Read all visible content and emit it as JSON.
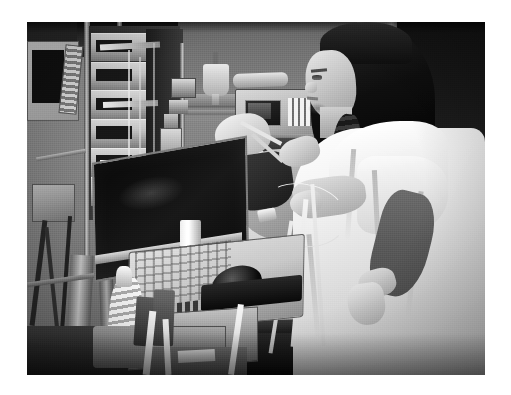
{
  "page": {
    "type": "photograph",
    "width": 511,
    "height": 395,
    "background_color": "#ffffff",
    "color_mode": "grayscale",
    "caption": ""
  },
  "photo": {
    "frame": {
      "left": 27,
      "top": 22,
      "width": 458,
      "height": 353
    },
    "alt_text": "Black and white photograph of a female clinician in a white gown performing a bedside ultrasound examination on a patient in an intensive care unit bed, surrounded by IV infusion pumps, a ventilator and a portable ultrasound cart.",
    "scene": "intensive-care-unit-bedside-ultrasound",
    "palette": {
      "wall_light": "#8d8d8d",
      "wall_mid": "#7d7d7d",
      "wall_dark": "#6d6d6d",
      "doorway_black": "#181818",
      "equipment_light": "#d2d2d2",
      "equipment_mid": "#9a9a9a",
      "equipment_dark": "#4a4a4a",
      "screen_black": "#101010",
      "gown_white": "#fbfbfb",
      "sheet_white": "#efefef",
      "skin_light": "#cfcfcf",
      "skin_shadow": "#5b5b5b",
      "hair_black": "#121212",
      "cable_white": "#f0f0f0",
      "floor_dark": "#2f2f2f"
    },
    "regions": [
      {
        "name": "wall-background",
        "description": "Plain grey hospital wall with horizontal service rail"
      },
      {
        "name": "doorway-dark",
        "description": "Dark doorway or window opening at upper right"
      },
      {
        "name": "iv-pump-tower",
        "description": "Vertical stack of six IV infusion pumps on a pole at left"
      },
      {
        "name": "bedside-monitor-left",
        "description": "Monitor with dark screen and angled keypad at far left"
      },
      {
        "name": "ventilator",
        "description": "Ventilator / infusion controller with small display and numeric keypad above the bed"
      },
      {
        "name": "iv-bag",
        "description": "Hanging IV fluid bag on a pole"
      },
      {
        "name": "ultrasound-machine",
        "description": "Portable laptop-style ultrasound with dark flat screen, key panel and trackball"
      },
      {
        "name": "ultrasound-probe",
        "description": "Transducer with coiled white cable resting in the cart holder"
      },
      {
        "name": "hospital-bed",
        "description": "Bed with white sheets, pillow and dark side rail"
      },
      {
        "name": "patient",
        "description": "Patient lying in bed with head dressing, monitoring leads and tubing"
      },
      {
        "name": "clinician",
        "description": "Woman in profile with dark braided hair wearing a white isolation gown, scanning the patient"
      },
      {
        "name": "monitoring-cables",
        "description": "White lead wires and tubing running from patient across the bed"
      },
      {
        "name": "floor",
        "description": "Dark floor and cart base at bottom left"
      }
    ],
    "subjects": {
      "clinician": {
        "pose": "standing in right profile, both arms reaching toward patient",
        "hair": "dark, long, worn in a braid over the shoulder",
        "clothing": "white isolation gown with short sleeves",
        "right_forearm": "bare, in shadow, angled down across the gown"
      },
      "patient": {
        "pose": "supine in bed, head to the left",
        "attachments": "endotracheal tubing, monitoring leads, sensor clip"
      }
    },
    "equipment_counts": {
      "iv_pumps": 6,
      "monitors": 2,
      "ultrasound_machines": 1,
      "iv_bags": 1
    }
  }
}
